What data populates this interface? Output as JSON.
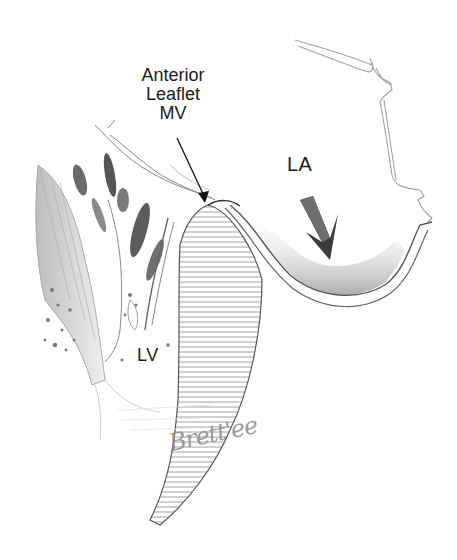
{
  "figure": {
    "type": "anatomical illustration",
    "labels": {
      "anterior_leaflet": [
        "Anterior",
        "Leaflet",
        "MV"
      ],
      "left_atrium": "LA",
      "left_ventricle": "LV"
    },
    "signature": "Brett'ee",
    "colors": {
      "background": "#ffffff",
      "ink": "#1a1a1a",
      "shading": "#555555",
      "light_line": "#9a9a9a"
    }
  }
}
